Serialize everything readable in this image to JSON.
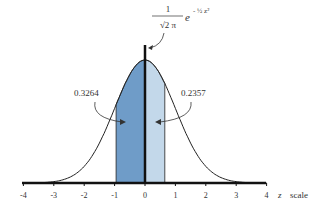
{
  "chart_data": {
    "type": "area",
    "formula": {
      "numerator": "1",
      "denominator": "√2π",
      "exp_base": "e",
      "exp_power": "-½z²"
    },
    "xlabel": "z scale",
    "xlim": [
      -4,
      4
    ],
    "ticks": [
      "-4",
      "-3",
      "-2",
      "-1",
      "0",
      "1",
      "2",
      "3",
      "4"
    ],
    "shaded_regions": [
      {
        "from": -0.95,
        "to": 0,
        "area": "0.3264",
        "color": "#6f9cc8"
      },
      {
        "from": 0,
        "to": 0.65,
        "area": "0.2357",
        "color": "#c3d8ea"
      }
    ]
  },
  "labels": {
    "left_area": "0.3264",
    "right_area": "0.2357",
    "z_letter": "z",
    "scale_word": "scale",
    "formula_num": "1",
    "formula_den": "√2 π",
    "formula_e": "e",
    "formula_exp": "- ½ z²"
  }
}
